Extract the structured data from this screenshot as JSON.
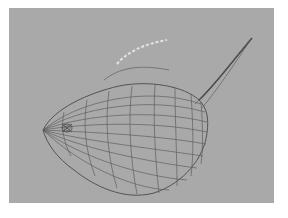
{
  "viewport": {
    "label": "3D modeling viewport",
    "background_color": "#a9a9a9",
    "object": {
      "name": "gourd-wireframe-mesh",
      "render_mode": "wireframe",
      "wire_color": "#5e5e5e",
      "has_stem": true,
      "has_selected_curve": true,
      "selection_highlight_color": "#e4e4e4"
    }
  }
}
